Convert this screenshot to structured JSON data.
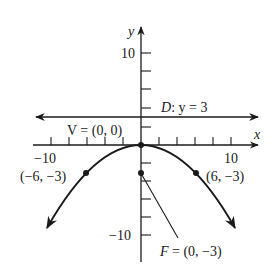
{
  "figure": {
    "type": "parabola-graph",
    "equation_form": "x^2 = -12y",
    "axes": {
      "x_label": "x",
      "y_label": "y",
      "x_tick_labels": [
        {
          "value": -10,
          "text": "−10"
        },
        {
          "value": 10,
          "text": "10"
        }
      ],
      "y_tick_labels": [
        {
          "value": 10,
          "text": "10"
        },
        {
          "value": -10,
          "text": "−10"
        }
      ],
      "tick_step": 2,
      "x_range": [
        -11,
        11
      ],
      "y_range": [
        -11,
        12
      ]
    },
    "directrix": {
      "label": "D: y = 3",
      "label_D": "D",
      "label_rest": ": y = 3",
      "y": 3
    },
    "vertex": {
      "label": "V = (0, 0)",
      "x": 0,
      "y": 0
    },
    "focus": {
      "label": "F = (0, −3)",
      "x": 0,
      "y": -3
    },
    "points": [
      {
        "label": "(−6, −3)",
        "x": -6,
        "y": -3
      },
      {
        "label": "(6, −3)",
        "x": 6,
        "y": -3
      }
    ],
    "colors": {
      "stroke": "#1a1a1a",
      "background": "#ffffff"
    }
  }
}
